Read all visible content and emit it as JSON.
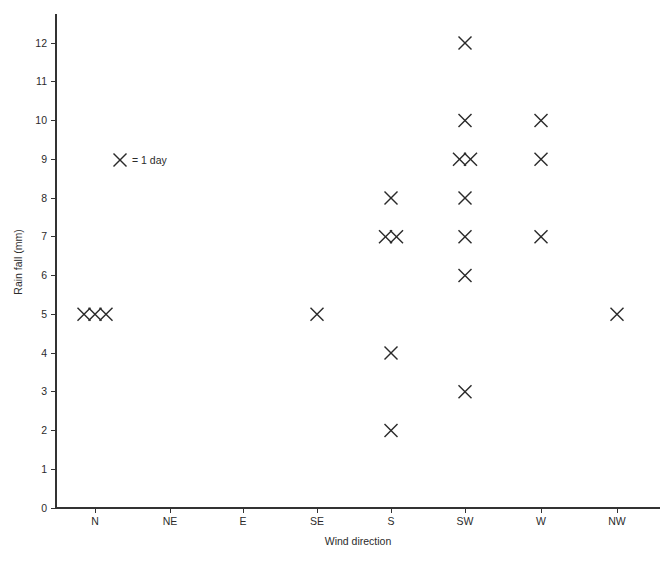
{
  "chart_data": {
    "type": "scatter",
    "title": "",
    "subtitle": "",
    "xlabel": "Wind direction",
    "ylabel": "Rain fall (mm)",
    "categories": [
      "N",
      "NE",
      "E",
      "SE",
      "S",
      "SW",
      "W",
      "NW"
    ],
    "ylim": [
      0,
      12
    ],
    "y_ticks": [
      0,
      1,
      2,
      3,
      4,
      5,
      6,
      7,
      8,
      9,
      10,
      11,
      12
    ],
    "y_tick_labels": [
      "0",
      "1",
      "2",
      "3",
      "4",
      "5",
      "6",
      "7",
      "8",
      "9",
      "10",
      "11",
      "12"
    ],
    "grid": false,
    "legend_position": "inside-upper-left",
    "legend_marker": "✕",
    "legend_text": "= 1 day",
    "legend_label": "✕ = 1 day",
    "marker_symbol": "cross",
    "marker_color": "#2a2a2a",
    "axis_color": "#333333",
    "background_color": "#ffffff",
    "counts_by_category": {
      "N": {
        "5": 3
      },
      "NE": {},
      "E": {},
      "SE": {
        "5": 1
      },
      "S": {
        "8": 1,
        "7": 2,
        "4": 1,
        "2": 1
      },
      "SW": {
        "12": 1,
        "10": 1,
        "9": 2,
        "8": 1,
        "7": 1,
        "6": 1,
        "3": 1
      },
      "W": {
        "10": 1,
        "9": 1,
        "7": 1
      },
      "NW": {
        "5": 1
      }
    },
    "points": [
      {
        "category": "N",
        "value": 5,
        "stack_index": 0
      },
      {
        "category": "N",
        "value": 5,
        "stack_index": 1
      },
      {
        "category": "N",
        "value": 5,
        "stack_index": 2
      },
      {
        "category": "SE",
        "value": 5,
        "stack_index": 0
      },
      {
        "category": "S",
        "value": 8,
        "stack_index": 0
      },
      {
        "category": "S",
        "value": 7,
        "stack_index": 0
      },
      {
        "category": "S",
        "value": 7,
        "stack_index": 1
      },
      {
        "category": "S",
        "value": 4,
        "stack_index": 0
      },
      {
        "category": "S",
        "value": 2,
        "stack_index": 0
      },
      {
        "category": "SW",
        "value": 12,
        "stack_index": 0
      },
      {
        "category": "SW",
        "value": 10,
        "stack_index": 0
      },
      {
        "category": "SW",
        "value": 9,
        "stack_index": 0
      },
      {
        "category": "SW",
        "value": 9,
        "stack_index": 1
      },
      {
        "category": "SW",
        "value": 8,
        "stack_index": 0
      },
      {
        "category": "SW",
        "value": 7,
        "stack_index": 0
      },
      {
        "category": "SW",
        "value": 6,
        "stack_index": 0
      },
      {
        "category": "SW",
        "value": 3,
        "stack_index": 0
      },
      {
        "category": "W",
        "value": 10,
        "stack_index": 0
      },
      {
        "category": "W",
        "value": 9,
        "stack_index": 0
      },
      {
        "category": "W",
        "value": 7,
        "stack_index": 0
      },
      {
        "category": "NW",
        "value": 5,
        "stack_index": 0
      }
    ]
  },
  "layout": {
    "plot_left": 56,
    "plot_right": 660,
    "plot_top": 14,
    "plot_bottom": 508,
    "category_x": [
      95,
      170,
      243,
      317,
      391,
      465,
      541,
      617
    ],
    "y_zero_px": 508,
    "y_unit_px": 38.75,
    "marker_half": 6.5,
    "marker_dx": 11,
    "legend_x": 120,
    "legend_y": 160,
    "x_title_y": 545,
    "y_title_x": 22,
    "y_title_y": 262
  }
}
